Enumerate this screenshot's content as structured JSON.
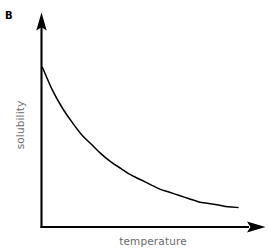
{
  "figure": {
    "panel_letter": "B",
    "background_color": "#ffffff",
    "axis_color": "#000000",
    "curve_color": "#000000",
    "label_color": "#6b6b6b"
  },
  "chart_data": {
    "type": "line",
    "title": "",
    "subtitle": "",
    "panel_label": "B",
    "xlabel": "temperature",
    "ylabel": "solubility",
    "grid": false,
    "legend": null,
    "axis_ticks": false,
    "tick_labels": {
      "x": [],
      "y": []
    },
    "xlim": [
      0,
      1
    ],
    "ylim": [
      0,
      1
    ],
    "annotations": [],
    "series": [
      {
        "name": "solubility",
        "x": [
          0.0,
          0.05,
          0.1,
          0.15,
          0.2,
          0.25,
          0.3,
          0.35,
          0.4,
          0.45,
          0.5,
          0.55,
          0.6,
          0.65,
          0.7,
          0.75,
          0.8,
          0.85,
          0.9,
          0.95,
          1.0
        ],
        "y": [
          1.0,
          0.86,
          0.75,
          0.66,
          0.58,
          0.52,
          0.46,
          0.41,
          0.37,
          0.33,
          0.3,
          0.27,
          0.24,
          0.22,
          0.2,
          0.18,
          0.16,
          0.15,
          0.14,
          0.13,
          0.125
        ]
      }
    ]
  },
  "labels": {
    "x_axis": "temperature",
    "y_axis": "solubility",
    "panel": "B"
  },
  "icons": {
    "y_axis_arrow": "arrow-up-icon",
    "x_axis_arrow": "arrow-right-icon"
  }
}
